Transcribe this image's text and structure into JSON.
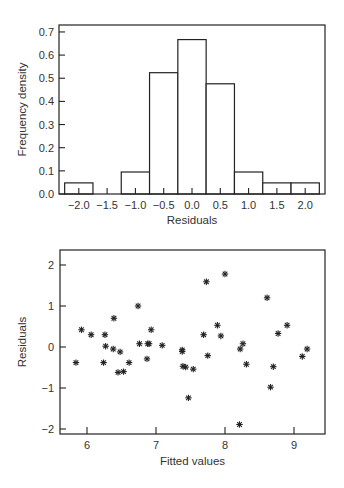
{
  "chart_data": [
    {
      "type": "bar",
      "subtype": "histogram",
      "title": "",
      "xlabel": "Residuals",
      "ylabel": "Frequency density",
      "categories": [
        "-2.0",
        "-1.5",
        "-1.0",
        "-0.5",
        "0.0",
        "0.5",
        "1.0",
        "1.5",
        "2.0"
      ],
      "bin_centers": [
        -2.0,
        -1.5,
        -1.0,
        -0.5,
        0.0,
        0.5,
        1.0,
        1.5,
        2.0
      ],
      "bin_width": 0.5,
      "values": [
        0.048,
        0.0,
        0.095,
        0.524,
        0.667,
        0.476,
        0.095,
        0.048,
        0.048
      ],
      "xticks": [
        "-2.0",
        "-1.5",
        "-1.0",
        "-0.5",
        "0.0",
        "0.5",
        "1.0",
        "1.5",
        "2.0"
      ],
      "yticks": [
        "0.0",
        "0.1",
        "0.2",
        "0.3",
        "0.4",
        "0.5",
        "0.6",
        "0.7"
      ],
      "xlim": [
        -2.35,
        2.35
      ],
      "ylim": [
        0.0,
        0.73
      ],
      "grid": false,
      "legend": null
    },
    {
      "type": "scatter",
      "title": "",
      "xlabel": "Fitted values",
      "ylabel": "Residuals",
      "marker": "asterisk",
      "x": [
        5.84,
        5.92,
        6.06,
        6.24,
        6.26,
        6.27,
        6.38,
        6.39,
        6.45,
        6.48,
        6.53,
        6.61,
        6.74,
        6.76,
        6.87,
        6.88,
        6.9,
        6.93,
        7.09,
        7.38,
        7.38,
        7.39,
        7.43,
        7.47,
        7.54,
        7.69,
        7.73,
        7.75,
        7.89,
        7.94,
        8.0,
        8.21,
        8.22,
        8.26,
        8.31,
        8.61,
        8.66,
        8.7,
        8.77,
        8.9,
        9.12,
        9.19
      ],
      "y": [
        -0.38,
        0.42,
        0.3,
        -0.38,
        0.3,
        0.02,
        -0.05,
        0.7,
        -0.62,
        -0.12,
        -0.6,
        -0.38,
        1.0,
        0.08,
        -0.29,
        0.08,
        0.08,
        0.42,
        0.04,
        -0.07,
        -0.11,
        -0.47,
        -0.49,
        -1.24,
        -0.54,
        0.3,
        1.59,
        -0.21,
        0.53,
        0.27,
        1.78,
        -1.89,
        -0.05,
        0.08,
        -0.42,
        1.2,
        -0.98,
        -0.48,
        0.33,
        0.53,
        -0.23,
        -0.05
      ],
      "xticks": [
        "6",
        "7",
        "8",
        "9"
      ],
      "yticks": [
        "2",
        "1",
        "0",
        "-1",
        "-2"
      ],
      "xlim": [
        5.62,
        9.46
      ],
      "ylim": [
        -2.1,
        2.2
      ],
      "grid": false,
      "legend": null
    }
  ]
}
